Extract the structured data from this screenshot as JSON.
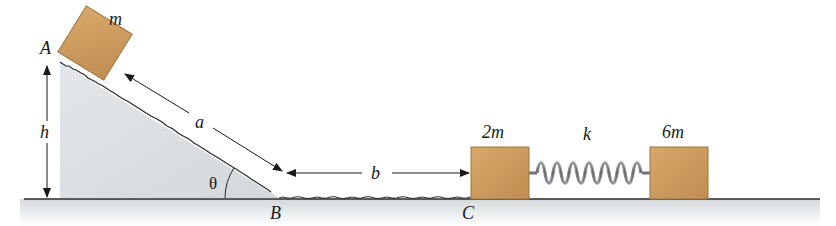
{
  "diagram": {
    "points": {
      "A": "A",
      "B": "B",
      "C": "C"
    },
    "masses": {
      "sliding_block": "m",
      "struck_block": "2m",
      "far_block": "6m"
    },
    "dimensions": {
      "incline_length": "a",
      "flat_distance": "b",
      "height": "h",
      "angle": "θ"
    },
    "spring": {
      "label": "k"
    },
    "colors": {
      "block": "#c9955a",
      "block_edge": "#8a6a3c",
      "ground_fill": "#dfe3e6",
      "spring": "#8a8e92",
      "line": "#2a2a2a"
    }
  }
}
